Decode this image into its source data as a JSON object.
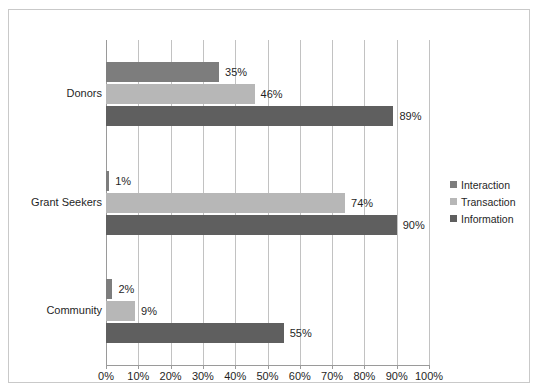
{
  "chart_data": {
    "type": "bar",
    "orientation": "horizontal",
    "title": "",
    "xlabel": "",
    "ylabel": "",
    "xlim": [
      0,
      100
    ],
    "xtick_labels": [
      "0%",
      "10%",
      "20%",
      "30%",
      "40%",
      "50%",
      "60%",
      "70%",
      "80%",
      "90%",
      "100%"
    ],
    "xtick_values": [
      0,
      10,
      20,
      30,
      40,
      50,
      60,
      70,
      80,
      90,
      100
    ],
    "grid": "vertical",
    "categories": [
      "Donors",
      "Grant Seekers",
      "Community"
    ],
    "series": [
      {
        "name": "Interaction",
        "color": "#7d7d7d",
        "values": [
          35,
          1,
          2
        ],
        "labels": [
          "35%",
          "1%",
          "2%"
        ]
      },
      {
        "name": "Transaction",
        "color": "#b7b7b7",
        "values": [
          46,
          74,
          9
        ],
        "labels": [
          "46%",
          "74%",
          "9%"
        ]
      },
      {
        "name": "Information",
        "color": "#5f5f5f",
        "values": [
          89,
          90,
          55
        ],
        "labels": [
          "89%",
          "90%",
          "55%"
        ]
      }
    ],
    "legend": {
      "position": "right",
      "entries": [
        "Interaction",
        "Transaction",
        "Information"
      ]
    }
  }
}
